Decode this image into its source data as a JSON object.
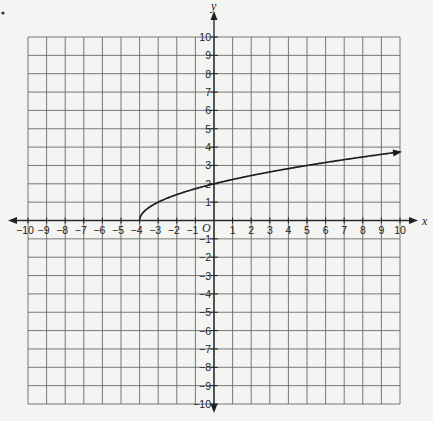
{
  "chart_data": {
    "type": "line",
    "title": "",
    "xlabel": "x",
    "ylabel": "y",
    "origin_label": "O",
    "xlim": [
      -10,
      10
    ],
    "ylim": [
      -10,
      10
    ],
    "grid": true,
    "x_ticks": [
      -10,
      -9,
      -8,
      -7,
      -6,
      -5,
      -4,
      -3,
      -2,
      -1,
      1,
      2,
      3,
      4,
      5,
      6,
      7,
      8,
      9,
      10
    ],
    "y_ticks": [
      10,
      9,
      8,
      7,
      6,
      5,
      4,
      3,
      2,
      1,
      -1,
      -2,
      -3,
      -4,
      -5,
      -6,
      -7,
      -8,
      -9,
      -10
    ],
    "series": [
      {
        "name": "f(x) = sqrt(x + 4)",
        "start_point": [
          -4,
          0
        ],
        "end_arrow": true,
        "x": [
          -4,
          -3,
          -2,
          -1,
          0,
          1,
          2,
          3,
          4,
          5,
          6,
          7,
          8,
          9,
          10
        ],
        "y": [
          0,
          1,
          1.41,
          1.73,
          2,
          2.24,
          2.45,
          2.65,
          2.83,
          3,
          3.16,
          3.32,
          3.46,
          3.61,
          3.74
        ]
      }
    ]
  },
  "colors": {
    "background": "#f4f4f2",
    "grid": "#6a6a6a",
    "axis": "#2a2a2a",
    "curve": "#1e1e1e"
  }
}
